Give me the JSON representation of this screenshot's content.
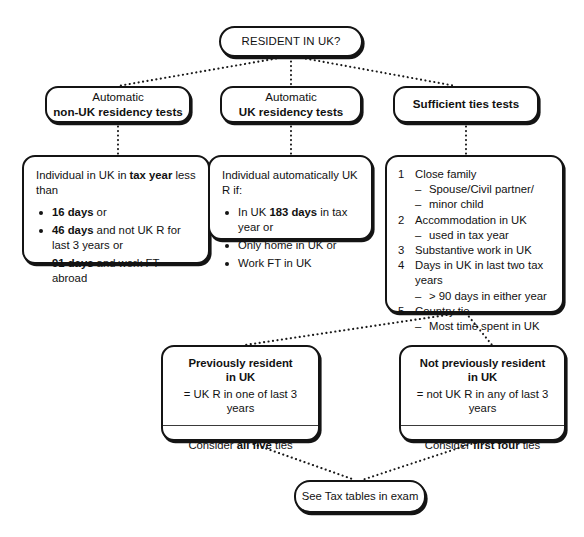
{
  "diagram": {
    "line_style": "dotted",
    "ink_color": "#141414"
  },
  "root": {
    "label": "RESIDENT IN UK?"
  },
  "headers": [
    {
      "line1": "Automatic",
      "line2": "non-UK residency tests"
    },
    {
      "line1": "Automatic",
      "line2": "UK residency tests"
    },
    {
      "line1": "",
      "line2": "Sufficient ties tests"
    }
  ],
  "automatic_non_uk": {
    "lead_a": "Individual in UK in ",
    "lead_b": "tax year",
    "lead_c": " less than",
    "bullets": [
      {
        "bold": "16 days",
        "rest": " or"
      },
      {
        "bold": "46 days",
        "rest": " and not UK R for last 3 years or"
      },
      {
        "bold": "91 days",
        "rest": " and work FT abroad"
      }
    ]
  },
  "automatic_uk": {
    "lead": "Individual automatically UK R if:",
    "bullets": [
      {
        "pre": "In UK ",
        "bold": "183 days",
        "rest": " in tax year or"
      },
      {
        "pre": "Only home in UK or",
        "bold": "",
        "rest": ""
      },
      {
        "pre": "Work FT in UK",
        "bold": "",
        "rest": ""
      }
    ]
  },
  "sufficient_ties": {
    "items": [
      {
        "num": "1",
        "text": "Close family",
        "subs": [
          "Spouse/Civil partner/",
          "minor child"
        ]
      },
      {
        "num": "2",
        "text": "Accommodation in UK",
        "subs": [
          "used in tax year"
        ]
      },
      {
        "num": "3",
        "text": "Substantive work in UK",
        "subs": []
      },
      {
        "num": "4",
        "text": "Days in UK in last two tax years",
        "subs": [
          "> 90 days in either year"
        ]
      },
      {
        "num": "5",
        "text": "Country tie",
        "subs": [
          "Most time spent in UK"
        ]
      }
    ]
  },
  "result_left": {
    "title_line1": "Previously resident",
    "title_line2": "in UK",
    "definition": "= UK R in one of last 3 years",
    "action_pre": "Consider ",
    "action_bold": "all five",
    "action_post": " ties"
  },
  "result_right": {
    "title_line1": "Not previously resident",
    "title_line2": "in UK",
    "definition": "= not UK R in any of last 3 years",
    "action_pre": "Consider ",
    "action_bold": "first four",
    "action_post": " ties"
  },
  "final": {
    "label": "See Tax tables in exam"
  }
}
